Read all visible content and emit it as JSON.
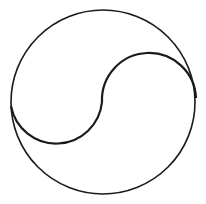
{
  "diagram": {
    "title": "",
    "shape": "yin-yang outline",
    "stroke_color": "#1a1a1a",
    "background_color": "#ffffff",
    "outer_circle": {
      "cx": 103,
      "cy": 102,
      "r": 92,
      "stroke_width": 1.6
    },
    "s_curve": {
      "start": [
        11,
        108
      ],
      "mid": [
        102,
        102
      ],
      "end": [
        196,
        96
      ],
      "stroke_width": 2.2
    }
  }
}
